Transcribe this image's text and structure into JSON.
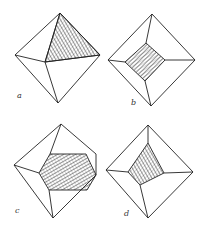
{
  "figures": [
    {
      "id": "a",
      "label": "a",
      "label_pos": [
        17,
        91
      ],
      "outline": [
        [
          60,
          13
        ],
        [
          100,
          55
        ],
        [
          58,
          103
        ],
        [
          15,
          55
        ]
      ],
      "edges": [
        [
          [
            60,
            13
          ],
          [
            45,
            62
          ]
        ],
        [
          [
            15,
            55
          ],
          [
            45,
            62
          ]
        ],
        [
          [
            45,
            62
          ],
          [
            100,
            55
          ]
        ],
        [
          [
            45,
            62
          ],
          [
            58,
            103
          ]
        ]
      ],
      "hatched": [
        [
          60,
          13
        ],
        [
          100,
          55
        ],
        [
          45,
          62
        ]
      ]
    },
    {
      "id": "b",
      "label": "b",
      "label_pos": [
        131,
        98
      ],
      "outline": [
        [
          152,
          14
        ],
        [
          195,
          60
        ],
        [
          151,
          106
        ],
        [
          108,
          60
        ]
      ],
      "edges": [
        [
          [
            152,
            14
          ],
          [
            146,
            43
          ]
        ],
        [
          [
            108,
            60
          ],
          [
            125,
            62
          ]
        ],
        [
          [
            165,
            60
          ],
          [
            195,
            60
          ]
        ],
        [
          [
            145,
            81
          ],
          [
            151,
            106
          ]
        ]
      ],
      "hatched": [
        [
          146,
          43
        ],
        [
          165,
          60
        ],
        [
          145,
          81
        ],
        [
          125,
          62
        ]
      ]
    },
    {
      "id": "c",
      "label": "c",
      "label_pos": [
        15,
        206
      ],
      "outline": [
        [
          61,
          124
        ],
        [
          96,
          154
        ],
        [
          96,
          175
        ],
        [
          53,
          218
        ],
        [
          14,
          165
        ]
      ],
      "edges": [
        [
          [
            61,
            124
          ],
          [
            50,
            154
          ]
        ],
        [
          [
            14,
            165
          ],
          [
            39,
            173
          ]
        ],
        [
          [
            49,
            190
          ],
          [
            53,
            218
          ]
        ]
      ],
      "hatched": [
        [
          50,
          154
        ],
        [
          86,
          154
        ],
        [
          96,
          175
        ],
        [
          87,
          190
        ],
        [
          49,
          190
        ],
        [
          39,
          173
        ]
      ]
    },
    {
      "id": "d",
      "label": "d",
      "label_pos": [
        124,
        209
      ],
      "outline": [
        [
          148,
          125
        ],
        [
          193,
          172
        ],
        [
          148,
          218
        ],
        [
          106,
          170
        ]
      ],
      "edges": [
        [
          [
            148,
            125
          ],
          [
            148,
            143
          ]
        ],
        [
          [
            106,
            170
          ],
          [
            128,
            172
          ]
        ],
        [
          [
            164,
            173
          ],
          [
            193,
            172
          ]
        ],
        [
          [
            140,
            185
          ],
          [
            148,
            218
          ]
        ]
      ],
      "hatched": [
        [
          148,
          143
        ],
        [
          164,
          173
        ],
        [
          140,
          185
        ],
        [
          128,
          172
        ]
      ]
    }
  ],
  "colors": {
    "line": "#222222",
    "hatch": "#333333",
    "background": "#ffffff"
  }
}
